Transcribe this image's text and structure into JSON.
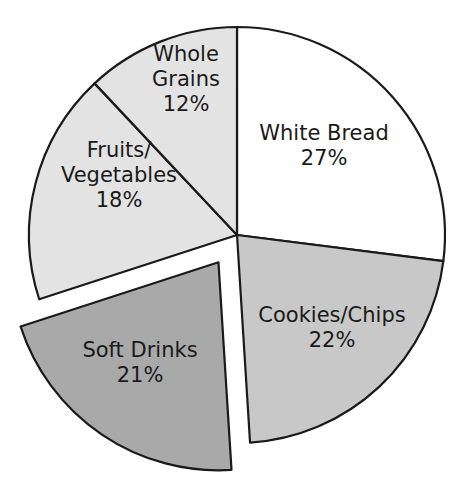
{
  "chart_data": {
    "type": "pie",
    "title": "",
    "start_angle_deg": 0,
    "direction": "clockwise",
    "center": [
      237,
      235
    ],
    "radius": 208,
    "slices": [
      {
        "label": "White Bread",
        "lines": [
          "White Bread"
        ],
        "value": 27,
        "value_label": "27%",
        "color": "#ffffff",
        "exploded": false,
        "label_pos": [
          324,
          145
        ]
      },
      {
        "label": "Cookies/Chips",
        "lines": [
          "Cookies/Chips"
        ],
        "value": 22,
        "value_label": "22%",
        "color": "#c8c8c8",
        "exploded": false,
        "label_pos": [
          332,
          327
        ]
      },
      {
        "label": "Soft Drinks",
        "lines": [
          "Soft Drinks"
        ],
        "value": 21,
        "value_label": "21%",
        "color": "#a9a9a9",
        "exploded": true,
        "explode_offset": 33,
        "label_pos": [
          140,
          362
        ]
      },
      {
        "label": "Fruits/Vegetables",
        "lines": [
          "Fruits/",
          "Vegetables"
        ],
        "value": 18,
        "value_label": "18%",
        "color": "#e3e3e3",
        "exploded": false,
        "label_pos": [
          119,
          175
        ]
      },
      {
        "label": "Whole Grains",
        "lines": [
          "Whole",
          "Grains"
        ],
        "value": 12,
        "value_label": "12%",
        "color": "#e3e3e3",
        "exploded": false,
        "label_pos": [
          186,
          79
        ]
      }
    ],
    "legend": null
  }
}
